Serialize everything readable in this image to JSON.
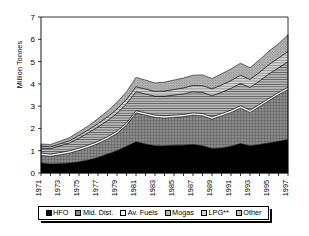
{
  "chart_data": {
    "type": "area",
    "stacked": true,
    "title": "",
    "xlabel": "",
    "ylabel": "Million Tonnes",
    "ylim": [
      0,
      7
    ],
    "yticks": [
      0,
      1,
      2,
      3,
      4,
      5,
      6,
      7
    ],
    "ytick_labels": [
      "0",
      "1",
      "2",
      "3",
      "4",
      "5",
      "6",
      "7"
    ],
    "grid": false,
    "legend_position": "bottom",
    "x": [
      1971,
      1972,
      1973,
      1974,
      1975,
      1976,
      1977,
      1978,
      1979,
      1980,
      1981,
      1982,
      1983,
      1984,
      1985,
      1986,
      1987,
      1988,
      1989,
      1990,
      1991,
      1992,
      1993,
      1994,
      1995,
      1996,
      1997
    ],
    "xtick_labels": [
      "1971",
      "1973",
      "1975",
      "1977",
      "1979",
      "1981",
      "1983",
      "1985",
      "1987",
      "1989",
      "1991",
      "1993",
      "1995",
      "1997"
    ],
    "xtick_values": [
      1971,
      1973,
      1975,
      1977,
      1979,
      1981,
      1983,
      1985,
      1987,
      1989,
      1991,
      1993,
      1995,
      1997
    ],
    "series": [
      {
        "name": "HFO",
        "color": "#000000",
        "pattern": "solid",
        "values": [
          0.45,
          0.4,
          0.42,
          0.45,
          0.5,
          0.58,
          0.7,
          0.85,
          1.0,
          1.2,
          1.4,
          1.3,
          1.22,
          1.22,
          1.25,
          1.25,
          1.28,
          1.22,
          1.1,
          1.12,
          1.2,
          1.32,
          1.22,
          1.28,
          1.35,
          1.42,
          1.5
        ]
      },
      {
        "name": "Mid. Dist.",
        "color": "#787878",
        "pattern": "crosshatch",
        "values": [
          0.35,
          0.35,
          0.4,
          0.45,
          0.52,
          0.58,
          0.62,
          0.68,
          0.78,
          0.95,
          1.3,
          1.3,
          1.28,
          1.25,
          1.25,
          1.28,
          1.32,
          1.35,
          1.32,
          1.45,
          1.52,
          1.6,
          1.5,
          1.7,
          1.9,
          2.1,
          2.25
        ]
      },
      {
        "name": "Av. Fuels",
        "color": "#ffffff",
        "pattern": "solid",
        "values": [
          0.1,
          0.1,
          0.1,
          0.1,
          0.1,
          0.1,
          0.1,
          0.1,
          0.1,
          0.1,
          0.1,
          0.1,
          0.1,
          0.1,
          0.1,
          0.1,
          0.1,
          0.1,
          0.1,
          0.1,
          0.1,
          0.1,
          0.1,
          0.1,
          0.1,
          0.1,
          0.1
        ]
      },
      {
        "name": "Mogas",
        "color": "#8c8c8c",
        "pattern": "hlines",
        "values": [
          0.22,
          0.25,
          0.3,
          0.35,
          0.45,
          0.55,
          0.65,
          0.72,
          0.8,
          0.85,
          0.85,
          0.85,
          0.85,
          0.88,
          0.9,
          0.92,
          0.95,
          0.95,
          0.95,
          0.95,
          0.98,
          1.0,
          1.02,
          1.05,
          1.1,
          1.1,
          1.15
        ]
      },
      {
        "name": "LPG**",
        "color": "#b4b4b4",
        "pattern": "hlines-light",
        "values": [
          0.08,
          0.08,
          0.09,
          0.1,
          0.12,
          0.13,
          0.15,
          0.17,
          0.19,
          0.21,
          0.22,
          0.22,
          0.21,
          0.23,
          0.25,
          0.27,
          0.28,
          0.3,
          0.31,
          0.33,
          0.35,
          0.37,
          0.36,
          0.39,
          0.42,
          0.44,
          0.46
        ]
      },
      {
        "name": "Other",
        "color": "#a0a0a0",
        "pattern": "dots",
        "values": [
          0.1,
          0.1,
          0.12,
          0.14,
          0.16,
          0.18,
          0.22,
          0.26,
          0.3,
          0.34,
          0.42,
          0.4,
          0.38,
          0.4,
          0.42,
          0.44,
          0.46,
          0.48,
          0.46,
          0.5,
          0.52,
          0.54,
          0.52,
          0.56,
          0.6,
          0.64,
          0.74
        ]
      }
    ],
    "totals": [
      1.3,
      1.28,
      1.43,
      1.59,
      1.85,
      2.12,
      2.44,
      2.78,
      3.17,
      3.65,
      4.29,
      4.17,
      4.04,
      4.08,
      4.17,
      4.26,
      4.39,
      4.4,
      4.24,
      4.45,
      4.67,
      4.93,
      4.72,
      5.08,
      5.47,
      5.8,
      6.2
    ]
  },
  "legend": {
    "items": [
      {
        "label": "HFO"
      },
      {
        "label": "Mid. Dist."
      },
      {
        "label": "Av. Fuels"
      },
      {
        "label": "Mogas"
      },
      {
        "label": "LPG**"
      },
      {
        "label": "Other"
      }
    ]
  }
}
